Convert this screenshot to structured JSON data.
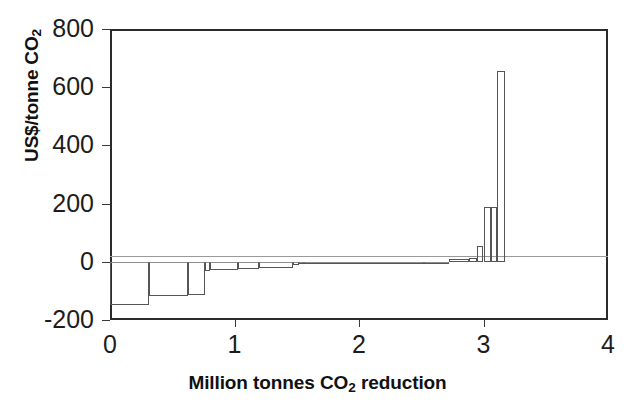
{
  "chart_data": {
    "type": "bar",
    "title": "",
    "xlabel": "Million tonnes CO2 reduction",
    "ylabel": "US$/tonne CO2",
    "xlim": [
      0,
      4
    ],
    "ylim": [
      -200,
      800
    ],
    "grid": false,
    "legend": null,
    "x_ticks": [
      "0",
      "1",
      "2",
      "3",
      "4"
    ],
    "x_tick_values": [
      0,
      1,
      2,
      3,
      4
    ],
    "y_ticks": [
      "800",
      "600",
      "400",
      "200",
      "0",
      "-200"
    ],
    "y_tick_values": [
      800,
      600,
      400,
      200,
      0,
      -200
    ],
    "bars": [
      {
        "x_start": 0.0,
        "x_end": 0.31,
        "value": -148
      },
      {
        "x_start": 0.31,
        "x_end": 0.63,
        "value": -118
      },
      {
        "x_start": 0.63,
        "x_end": 0.76,
        "value": -115
      },
      {
        "x_start": 0.76,
        "x_end": 0.8,
        "value": -30
      },
      {
        "x_start": 0.8,
        "x_end": 1.03,
        "value": -28
      },
      {
        "x_start": 1.03,
        "x_end": 1.2,
        "value": -25
      },
      {
        "x_start": 1.2,
        "x_end": 1.47,
        "value": -22
      },
      {
        "x_start": 1.47,
        "x_end": 1.52,
        "value": -12
      },
      {
        "x_start": 1.52,
        "x_end": 1.56,
        "value": -8
      },
      {
        "x_start": 1.56,
        "x_end": 2.52,
        "value": -7
      },
      {
        "x_start": 2.52,
        "x_end": 2.72,
        "value": -5
      },
      {
        "x_start": 2.72,
        "x_end": 2.88,
        "value": 8
      },
      {
        "x_start": 2.88,
        "x_end": 2.95,
        "value": 12
      },
      {
        "x_start": 2.95,
        "x_end": 3.0,
        "value": 55
      },
      {
        "x_start": 3.0,
        "x_end": 3.06,
        "value": 190
      },
      {
        "x_start": 3.06,
        "x_end": 3.11,
        "value": 190
      },
      {
        "x_start": 3.11,
        "x_end": 3.17,
        "value": 655
      }
    ]
  }
}
